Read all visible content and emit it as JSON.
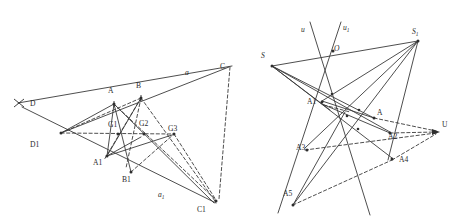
{
  "figure": {
    "style": {
      "line_color": "#3a3a3a",
      "label_color": "#2b2b2b",
      "background": "#ffffff",
      "dash_pattern": "3.2 2.4"
    },
    "left_diagram": {
      "name": "left-construction",
      "labels": [
        {
          "id": "D",
          "text": "D",
          "x": 30,
          "y": 106,
          "italic": false,
          "sub": ""
        },
        {
          "id": "D1",
          "text": "D1",
          "x": 30,
          "y": 147,
          "italic": false,
          "sub": ""
        },
        {
          "id": "A",
          "text": "A",
          "x": 95,
          "y": 92,
          "italic": false,
          "sub": ""
        },
        {
          "id": "B",
          "text": "B",
          "x": 128,
          "y": 88,
          "italic": false,
          "sub": ""
        },
        {
          "id": "C",
          "text": "C",
          "x": 216,
          "y": 71,
          "italic": false,
          "sub": ""
        },
        {
          "id": "A1",
          "text": "A1",
          "x": 90,
          "y": 162,
          "italic": false,
          "sub": ""
        },
        {
          "id": "B1",
          "text": "B1",
          "x": 123,
          "y": 178,
          "italic": false,
          "sub": ""
        },
        {
          "id": "C1",
          "text": "C1",
          "x": 196,
          "y": 209,
          "italic": false,
          "sub": ""
        },
        {
          "id": "G1",
          "text": "G1",
          "x": 106,
          "y": 127,
          "italic": false,
          "sub": ""
        },
        {
          "id": "G2",
          "text": "G2",
          "x": 138,
          "y": 126,
          "italic": false,
          "sub": ""
        },
        {
          "id": "G3",
          "text": "G3",
          "x": 168,
          "y": 129,
          "italic": false,
          "sub": ""
        },
        {
          "id": "a",
          "text": "a",
          "x": 186,
          "y": 73,
          "italic": true,
          "sub": ""
        },
        {
          "id": "a1",
          "text": "a",
          "x": 160,
          "y": 196,
          "italic": true,
          "sub": "1"
        }
      ]
    },
    "right_diagram": {
      "name": "right-construction",
      "labels": [
        {
          "id": "u",
          "text": "u",
          "x": 303,
          "y": 30,
          "italic": true,
          "sub": ""
        },
        {
          "id": "u1",
          "text": "u",
          "x": 345,
          "y": 28,
          "italic": true,
          "sub": "1"
        },
        {
          "id": "S",
          "text": "S",
          "x": 264,
          "y": 59,
          "italic": true,
          "sub": ""
        },
        {
          "id": "S1",
          "text": "S",
          "x": 415,
          "y": 33,
          "italic": true,
          "sub": "1"
        },
        {
          "id": "O",
          "text": "O",
          "x": 335,
          "y": 53,
          "italic": true,
          "sub": ""
        },
        {
          "id": "A1r",
          "text": "A1",
          "x": 308,
          "y": 103,
          "italic": false,
          "sub": ""
        },
        {
          "id": "Ar",
          "text": "A",
          "x": 376,
          "y": 113,
          "italic": false,
          "sub": ""
        },
        {
          "id": "A2",
          "text": "A2",
          "x": 388,
          "y": 136,
          "italic": false,
          "sub": ""
        },
        {
          "id": "A3",
          "text": "A3",
          "x": 300,
          "y": 148,
          "italic": false,
          "sub": ""
        },
        {
          "id": "A4",
          "text": "A4",
          "x": 402,
          "y": 160,
          "italic": false,
          "sub": ""
        },
        {
          "id": "A5",
          "text": "A5",
          "x": 286,
          "y": 195,
          "italic": false,
          "sub": ""
        },
        {
          "id": "U",
          "text": "U",
          "x": 442,
          "y": 124,
          "italic": false,
          "sub": ""
        }
      ]
    }
  }
}
